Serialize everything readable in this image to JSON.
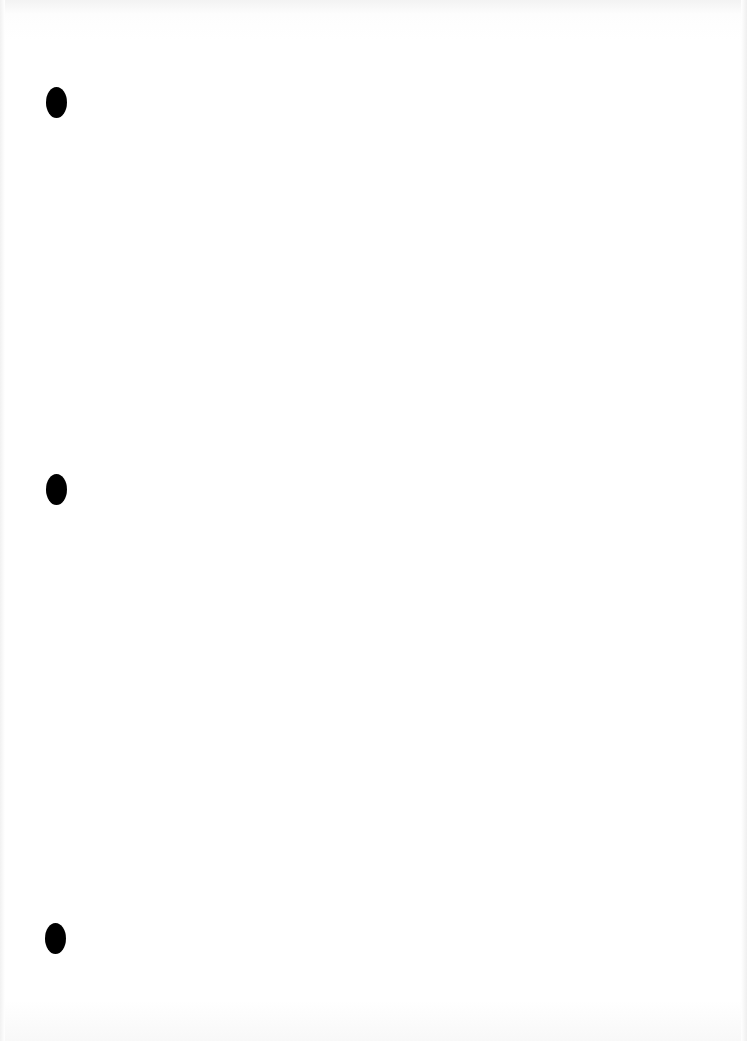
{
  "document": {
    "type": "blank scanned page",
    "text": "",
    "background_color": "#ffffff",
    "punch_holes": [
      {
        "label": "top",
        "x": 57,
        "y": 102
      },
      {
        "label": "middle",
        "x": 57,
        "y": 490
      },
      {
        "label": "bottom",
        "x": 56,
        "y": 938
      }
    ],
    "hole_color": "#000000"
  }
}
